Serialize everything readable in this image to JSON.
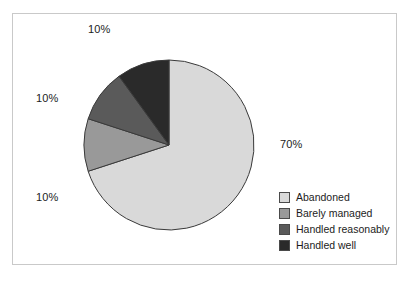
{
  "figure": {
    "background_color": "#ffffff",
    "frame_border_color": "#c9c9c9",
    "slice_outline_color": "#3a3a3a"
  },
  "labels": {
    "handled_well_pct": "10%",
    "handled_reasonably_pct": "10%",
    "barely_managed_pct": "10%",
    "abandoned_pct": "70%"
  },
  "legend": {
    "items": [
      {
        "label": "Abandoned",
        "color": "#d9d9d9"
      },
      {
        "label": "Barely managed",
        "color": "#999999"
      },
      {
        "label": "Handled reasonably",
        "color": "#5a5a5a"
      },
      {
        "label": "Handled well",
        "color": "#2a2a2a"
      }
    ]
  },
  "chart_data": {
    "type": "pie",
    "title": "",
    "subtitle": "",
    "xlabel": "",
    "ylabel": "",
    "grid": false,
    "legend_position": "bottom-right",
    "start_angle_deg": 90,
    "direction": "clockwise",
    "center_px": [
      169,
      145
    ],
    "radius_px": 85,
    "categories": [
      "Abandoned",
      "Barely managed",
      "Handled reasonably",
      "Handled well"
    ],
    "values": [
      70,
      10,
      10,
      10
    ],
    "value_unit": "percent",
    "data_labels": [
      "70%",
      "10%",
      "10%",
      "10%"
    ],
    "colors": [
      "#d9d9d9",
      "#999999",
      "#5a5a5a",
      "#2a2a2a"
    ],
    "slices": [
      {
        "label": "Abandoned",
        "value": 70,
        "data_label": "70%",
        "color": "#d9d9d9",
        "start_deg": 0,
        "end_deg": 252
      },
      {
        "label": "Barely managed",
        "value": 10,
        "data_label": "10%",
        "color": "#999999",
        "start_deg": 252,
        "end_deg": 288
      },
      {
        "label": "Handled reasonably",
        "value": 10,
        "data_label": "10%",
        "color": "#5a5a5a",
        "start_deg": 288,
        "end_deg": 324
      },
      {
        "label": "Handled well",
        "value": 10,
        "data_label": "10%",
        "color": "#2a2a2a",
        "start_deg": 324,
        "end_deg": 360
      }
    ]
  }
}
